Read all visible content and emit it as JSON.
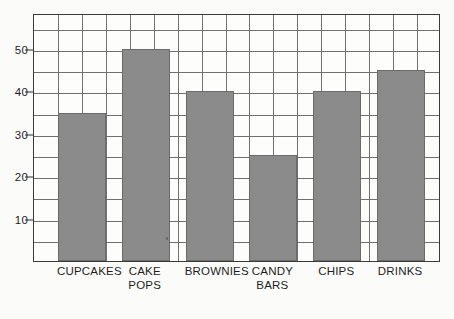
{
  "chart_data": {
    "type": "bar",
    "title": "",
    "subtitle": "",
    "xlabel": "",
    "ylabel": "",
    "categories": [
      "CUPCAKES",
      "CAKE\nPOPS",
      "BROWNIES",
      "CANDY\nBARS",
      "CHIPS",
      "DRINKS"
    ],
    "values": [
      35,
      50,
      40,
      25,
      40,
      45
    ],
    "ylim": [
      0,
      58.5
    ],
    "y_ticks": [
      10,
      20,
      30,
      40,
      50
    ],
    "y_tick_labels": [
      "10",
      "20",
      "30",
      "40",
      "50"
    ],
    "grid": true,
    "grid_step_y": 5,
    "grid_columns": 17,
    "legend": "none",
    "bar_color": "#8b8b8b",
    "bar_edge_color": "#6b6b6b",
    "grid_color": "#6f6f6f",
    "frame_color": "#3a3a3a",
    "background_color": "#fdfdfc"
  },
  "axes": {
    "y_ticks": [
      {
        "label": "10",
        "value": 10
      },
      {
        "label": "20",
        "value": 20
      },
      {
        "label": "30",
        "value": 30
      },
      {
        "label": "40",
        "value": 40
      },
      {
        "label": "50",
        "value": 50
      }
    ],
    "x_categories": [
      {
        "label": "CUPCAKES",
        "lines": [
          "CUPCAKES"
        ]
      },
      {
        "label": "CAKE POPS",
        "lines": [
          "CAKE",
          "POPS"
        ]
      },
      {
        "label": "BROWNIES",
        "lines": [
          "BROWNIES"
        ]
      },
      {
        "label": "CANDY BARS",
        "lines": [
          "CANDY",
          "BARS"
        ]
      },
      {
        "label": "CHIPS",
        "lines": [
          "CHIPS"
        ]
      },
      {
        "label": "DRINKS",
        "lines": [
          "DRINKS"
        ]
      }
    ]
  }
}
